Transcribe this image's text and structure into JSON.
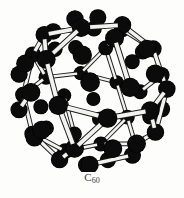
{
  "figure": {
    "kind": "molecular-structure-diagram",
    "caption_element": "C",
    "caption_subscript": "60",
    "caption_full": "C60",
    "atom_count": 60,
    "bond_count": 90,
    "model_style": "ball-and-stick",
    "polyhedron": "truncated icosahedron",
    "face_counts": {
      "hexagons": 20,
      "pentagons": 12
    }
  },
  "colors": {
    "background": "#fdfdfc",
    "atom_fill": "#0b0b0b",
    "atom_edge": "#000000",
    "bond_fill": "#f2f2ef",
    "bond_edge": "#1a1a1a",
    "caption_text": "#3a3a3a"
  },
  "render": {
    "canvas_width": 184,
    "canvas_height": 172,
    "center_x": 92,
    "center_y": 92,
    "sphere_radius": 74,
    "atom_radius_near": 9.2,
    "atom_radius_far": 6.4,
    "bond_width_near": 4.6,
    "bond_width_far": 2.6,
    "rotate_x_deg": -18,
    "rotate_y_deg": 26,
    "rotate_z_deg": 8,
    "perspective": 430
  },
  "chart_data": {
    "type": "scatter",
    "title": "C60",
    "xlabel": "",
    "ylabel": "",
    "vertices_unit": [
      [
        0,
        1,
        3
      ],
      [
        0,
        1,
        -3
      ],
      [
        0,
        -1,
        3
      ],
      [
        0,
        -1,
        -3
      ],
      [
        1,
        3,
        0
      ],
      [
        1,
        -3,
        0
      ],
      [
        -1,
        3,
        0
      ],
      [
        -1,
        -3,
        0
      ],
      [
        3,
        0,
        1
      ],
      [
        -3,
        0,
        1
      ],
      [
        3,
        0,
        -1
      ],
      [
        -3,
        0,
        -1
      ],
      [
        1,
        2,
        2.618034
      ],
      [
        1,
        2,
        -2.618034
      ],
      [
        1,
        -2,
        2.618034
      ],
      [
        1,
        -2,
        -2.618034
      ],
      [
        -1,
        2,
        2.618034
      ],
      [
        -1,
        2,
        -2.618034
      ],
      [
        -1,
        -2,
        2.618034
      ],
      [
        -1,
        -2,
        -2.618034
      ],
      [
        2,
        2.618034,
        1
      ],
      [
        2,
        2.618034,
        -1
      ],
      [
        2,
        -2.618034,
        1
      ],
      [
        2,
        -2.618034,
        -1
      ],
      [
        -2,
        2.618034,
        1
      ],
      [
        -2,
        2.618034,
        -1
      ],
      [
        -2,
        -2.618034,
        1
      ],
      [
        -2,
        -2.618034,
        -1
      ],
      [
        2.618034,
        1,
        2
      ],
      [
        2.618034,
        1,
        -2
      ],
      [
        2.618034,
        -1,
        2
      ],
      [
        2.618034,
        -1,
        -2
      ],
      [
        -2.618034,
        1,
        2
      ],
      [
        -2.618034,
        1,
        -2
      ],
      [
        -2.618034,
        -1,
        2
      ],
      [
        -2.618034,
        -1,
        -2
      ],
      [
        1.618034,
        0.618034,
        3.236068
      ],
      [
        1.618034,
        0.618034,
        -3.236068
      ],
      [
        1.618034,
        -0.618034,
        3.236068
      ],
      [
        1.618034,
        -0.618034,
        -3.236068
      ],
      [
        -1.618034,
        0.618034,
        3.236068
      ],
      [
        -1.618034,
        0.618034,
        -3.236068
      ],
      [
        -1.618034,
        -0.618034,
        3.236068
      ],
      [
        -1.618034,
        -0.618034,
        -3.236068
      ],
      [
        0.618034,
        3.236068,
        1.618034
      ],
      [
        0.618034,
        3.236068,
        -1.618034
      ],
      [
        0.618034,
        -3.236068,
        1.618034
      ],
      [
        0.618034,
        -3.236068,
        -1.618034
      ],
      [
        -0.618034,
        3.236068,
        1.618034
      ],
      [
        -0.618034,
        3.236068,
        -1.618034
      ],
      [
        -0.618034,
        -3.236068,
        1.618034
      ],
      [
        -0.618034,
        -3.236068,
        -1.618034
      ],
      [
        3.236068,
        1.618034,
        0.618034
      ],
      [
        3.236068,
        1.618034,
        -0.618034
      ],
      [
        3.236068,
        -1.618034,
        0.618034
      ],
      [
        3.236068,
        -1.618034,
        -0.618034
      ],
      [
        -3.236068,
        1.618034,
        0.618034
      ],
      [
        -3.236068,
        1.618034,
        -0.618034
      ],
      [
        -3.236068,
        -1.618034,
        0.618034
      ],
      [
        -3.236068,
        -1.618034,
        -0.618034
      ]
    ],
    "bond_length_unit": 2.0,
    "bond_length_tolerance": 0.25
  }
}
